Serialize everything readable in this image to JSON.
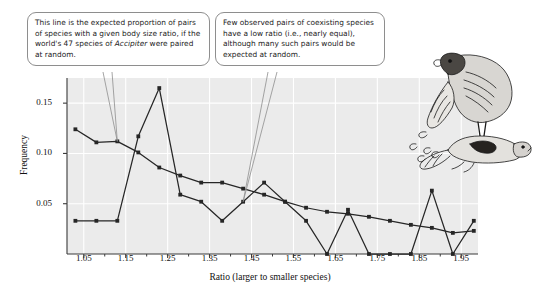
{
  "figure": {
    "callout_expected": "This line is the expected proportion of pairs of species with a given body size ratio, if the world's 47 species of Accipiter were paired at random.",
    "callout_expected_pre": "This line is the expected proportion of pairs of species with a given body size ratio, if the world's 47 species of ",
    "callout_expected_italic": "Accipiter",
    "callout_expected_post": " were paired at random.",
    "callout_observed": "Few observed pairs of coexisting species have a low ratio (i.e., nearly equal), although many such pairs would be expected at random.",
    "illustration_name": "accipiter-hawk-with-prey"
  },
  "chart_data": {
    "type": "line",
    "title": "",
    "xlabel": "Ratio (larger to smaller species)",
    "ylabel": "Frequency",
    "xlim": [
      1.01,
      1.99
    ],
    "ylim": [
      0.0,
      0.175
    ],
    "xticks": [
      1.05,
      1.15,
      1.25,
      1.35,
      1.45,
      1.55,
      1.65,
      1.75,
      1.85,
      1.95
    ],
    "xticklabels": [
      "1.05",
      "1.15",
      "1.25",
      "1.35",
      "1.45",
      "1.55",
      "1.65",
      "1.75",
      "1.85",
      "1.95"
    ],
    "yticks": [
      0.05,
      0.1,
      0.15
    ],
    "yticklabels": [
      "0.05",
      "0.10",
      "0.15"
    ],
    "grid": true,
    "grid_color": "#ffffff",
    "plot_background": "#ebebeb",
    "line_color": "#262626",
    "marker": "square",
    "legend": "none",
    "x": [
      1.03,
      1.08,
      1.13,
      1.18,
      1.23,
      1.28,
      1.33,
      1.38,
      1.43,
      1.48,
      1.53,
      1.58,
      1.63,
      1.68,
      1.73,
      1.78,
      1.83,
      1.88,
      1.93,
      1.98
    ],
    "series": [
      {
        "name": "Expected (random pairing)",
        "values": [
          0.124,
          0.111,
          0.112,
          0.101,
          0.086,
          0.078,
          0.071,
          0.071,
          0.065,
          0.059,
          0.052,
          0.046,
          0.042,
          0.04,
          0.037,
          0.033,
          0.029,
          0.026,
          0.021,
          0.023
        ]
      },
      {
        "name": "Observed (coexisting pairs)",
        "values": [
          0.033,
          0.033,
          0.033,
          0.117,
          0.165,
          0.059,
          0.052,
          0.033,
          0.052,
          0.071,
          0.052,
          0.033,
          0.0,
          0.044,
          0.0,
          0.0,
          0.0,
          0.063,
          0.0,
          0.033
        ]
      }
    ],
    "annotations": [
      {
        "name": "callout-expected",
        "text": "This line is the expected proportion of pairs of species with a given body size ratio, if the world's 47 species of Accipiter were paired at random.",
        "points_to_series": "Expected (random pairing)",
        "points_to_x": 1.13
      },
      {
        "name": "callout-observed",
        "text": "Few observed pairs of coexisting species have a low ratio (i.e., nearly equal), although many such pairs would be expected at random.",
        "points_to_series": "Observed (coexisting pairs)",
        "points_to_x": 1.43
      }
    ]
  }
}
